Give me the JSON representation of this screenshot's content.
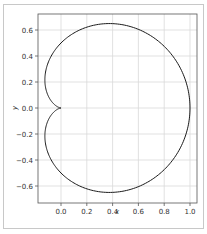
{
  "chart_data": {
    "type": "line",
    "title": "",
    "xlabel": "x",
    "ylabel": "y",
    "xlim": [
      -0.18,
      1.05
    ],
    "ylim": [
      -0.73,
      0.73
    ],
    "grid": true,
    "legend": null,
    "xticks": [
      0.0,
      0.2,
      0.4,
      0.6,
      0.8,
      1.0
    ],
    "xtick_labels": [
      "0.0",
      "0.2",
      "0.4",
      "0.6",
      "0.8",
      "1.0"
    ],
    "yticks": [
      -0.6,
      -0.4,
      -0.2,
      0.0,
      0.2,
      0.4,
      0.6
    ],
    "ytick_labels": [
      "−0.6",
      "−0.4",
      "−0.2",
      "0.0",
      "0.2",
      "0.4",
      "0.6"
    ],
    "series": [
      {
        "name": "cardioid",
        "equation": "r = (1 + cosθ) / 2",
        "color": "#000000",
        "points_note": "x = r cosθ, y = r sinθ, θ ∈ [0, 2π]",
        "sample_points": [
          {
            "x": 1.0,
            "y": 0.0
          },
          {
            "x": 0.375,
            "y": 0.65
          },
          {
            "x": -0.125,
            "y": 0.217
          },
          {
            "x": 0.0,
            "y": 0.0
          },
          {
            "x": -0.125,
            "y": -0.217
          },
          {
            "x": 0.375,
            "y": -0.65
          }
        ]
      }
    ]
  },
  "colors": {
    "curve": "#1a1a1a",
    "grid": "#d9d9d9",
    "axes": "#555555",
    "frame": "#c8c8c8"
  }
}
